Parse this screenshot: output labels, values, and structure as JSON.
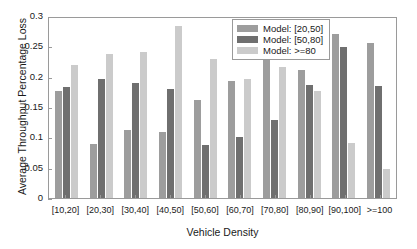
{
  "chart_data": {
    "type": "bar",
    "title": "",
    "xlabel": "Vehicle Density",
    "ylabel": "Average Throughput Percentage Loss",
    "categories": [
      "[10,20]",
      "[20,30]",
      "[30,40]",
      "[40,50]",
      "[50,60]",
      "[60,70]",
      "[70,80]",
      "[80,90]",
      "[90,100]",
      ">=100"
    ],
    "ylim": [
      0,
      0.3
    ],
    "yticks": [
      0,
      0.05,
      0.1,
      0.15,
      0.2,
      0.25,
      0.3
    ],
    "ytick_labels": [
      "0",
      "0.05",
      "0.1",
      "0.15",
      "0.2",
      "0.25",
      "0.3"
    ],
    "grid": false,
    "legend_position": "top-right",
    "series": [
      {
        "name": "Model: [20,50]",
        "color": "#9d9d9d",
        "values": [
          0.177,
          0.089,
          0.112,
          0.109,
          0.162,
          0.193,
          0.229,
          0.211,
          0.271,
          0.256
        ]
      },
      {
        "name": "Model: [50,80]",
        "color": "#6f6f6f",
        "values": [
          0.183,
          0.197,
          0.19,
          0.179,
          0.087,
          0.1,
          0.128,
          0.187,
          0.249,
          0.185
        ]
      },
      {
        "name": "Model: >=80",
        "color": "#cbcbcb",
        "values": [
          0.219,
          0.238,
          0.241,
          0.283,
          0.229,
          0.197,
          0.216,
          0.176,
          0.09,
          0.048
        ]
      }
    ]
  }
}
